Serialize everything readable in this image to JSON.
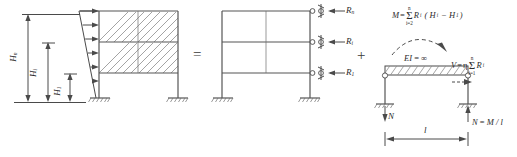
{
  "diagram": {
    "operators": {
      "equals": "=",
      "plus": "+"
    },
    "panel_a": {
      "name": "braced-frame-with-triangular-lateral-load",
      "dimensions": [
        {
          "id": "Hn",
          "base": "H",
          "sub": "n"
        },
        {
          "id": "Hi",
          "base": "H",
          "sub": "i"
        },
        {
          "id": "H1",
          "base": "H",
          "sub": "1"
        }
      ],
      "load_arrow_count": 6,
      "load_profile": "triangular"
    },
    "panel_b": {
      "name": "equivalent-frame-with-roller-reactions",
      "reactions": [
        {
          "id": "Rn",
          "base": "R",
          "sub": "n"
        },
        {
          "id": "Ri",
          "base": "R",
          "sub": "i"
        },
        {
          "id": "R1",
          "base": "R",
          "sub": "1"
        }
      ],
      "support_type": "fixed-base",
      "storeys": 3
    },
    "panel_c": {
      "name": "rigid-link-substructure",
      "moment_eq": {
        "lhs": "M",
        "rel": "=",
        "sum_upper": "n",
        "sum_lower": "i=2",
        "term": "R",
        "term_sub": "i",
        "paren": "( H",
        "paren_sub1": "i",
        "minus": "− H",
        "paren_sub2": "1",
        "close": " )"
      },
      "shear_eq": {
        "lhs": "V",
        "rel": "=",
        "eta": "η",
        "sum_upper": "n",
        "sum_lower": "i=1",
        "term": "R",
        "term_sub": "i"
      },
      "stiffness_label": {
        "base": "EI",
        "rel": "=",
        "value": "∞"
      },
      "axial_left": "N",
      "axial_right": {
        "base": "N",
        "rel": "=",
        "expr": "M / l"
      },
      "span_label": "l"
    }
  }
}
